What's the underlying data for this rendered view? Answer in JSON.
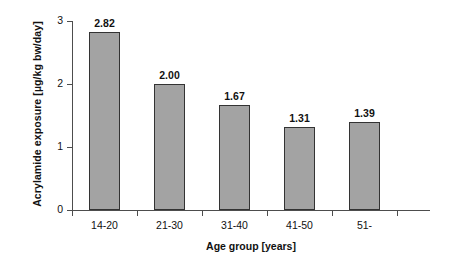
{
  "chart_data": {
    "type": "bar",
    "title": "",
    "categories": [
      "14-20",
      "21-30",
      "31-40",
      "41-50",
      "51-"
    ],
    "values": [
      2.82,
      2.0,
      1.67,
      1.31,
      1.39
    ],
    "data_labels": [
      "2.82",
      "2.00",
      "1.67",
      "1.31",
      "1.39"
    ],
    "xlabel": "Age group [years]",
    "ylabel": "Acrylamide exposure [µg/kg bw/day]",
    "ylim": [
      0,
      3
    ],
    "ytick_labels": [
      "0",
      "1",
      "2",
      "3"
    ],
    "ytick_values": [
      0,
      1,
      2,
      3
    ],
    "grid": false,
    "legend": false,
    "bar_color": "#a3a3a3",
    "bar_edge_color": "#333333",
    "axis_color": "#4d4d4d",
    "background_color": "#ffffff"
  }
}
